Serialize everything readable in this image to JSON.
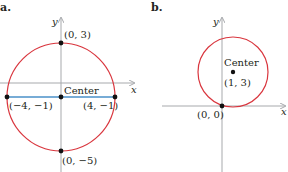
{
  "colors": {
    "circle": "#d9363e",
    "axis": "#a7a9ac",
    "diameter": "#4a90c8",
    "point": "#111111",
    "text": "#231f20"
  },
  "panels": [
    {
      "label": "a.",
      "x_axis_label": "x",
      "y_axis_label": "y",
      "center_label": "Center",
      "points": [
        {
          "label": "(0, 3)"
        },
        {
          "label": "(−4, −1)"
        },
        {
          "label": "(4, −1)"
        },
        {
          "label": "(0, −5)"
        }
      ]
    },
    {
      "label": "b.",
      "x_axis_label": "x",
      "y_axis_label": "y",
      "center_label": "Center",
      "center_coords": "(1, 3)",
      "points": [
        {
          "label": "(0, 0)"
        }
      ]
    }
  ]
}
